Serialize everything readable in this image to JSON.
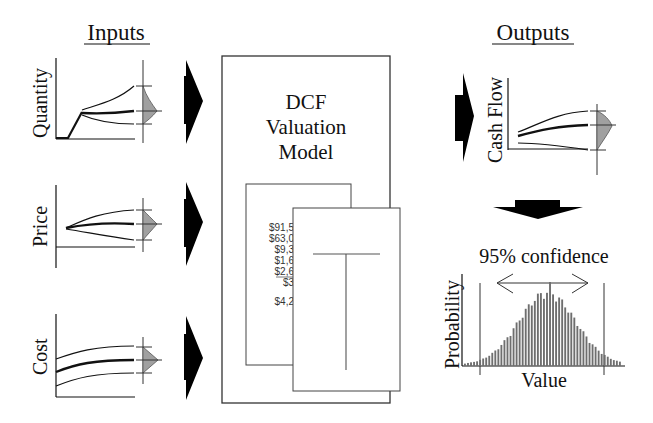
{
  "diagram": {
    "inputs_title": "Inputs",
    "outputs_title": "Outputs",
    "model": {
      "line1": "DCF",
      "line2": "Valuation",
      "line3": "Model",
      "spreadsheet_values": [
        "$91,5",
        "$63,0",
        "$9,3",
        "$1,6",
        "$2,6",
        "$3",
        "$4,2"
      ]
    },
    "inputs": [
      {
        "label": "Quantity"
      },
      {
        "label": "Price"
      },
      {
        "label": "Cost"
      }
    ],
    "outputs": {
      "cash_flow_label": "Cash Flow",
      "histogram": {
        "ylabel": "Probability",
        "xlabel": "Value",
        "annotation": "95% confidence"
      }
    },
    "colors": {
      "line": "#111111",
      "distribution_fill": "#a0a0a0",
      "histogram_bar": "#6e6e6e",
      "box_border": "#333333"
    }
  }
}
